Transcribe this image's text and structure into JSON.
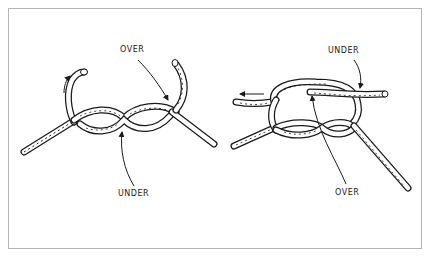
{
  "diagram": {
    "panels": [
      {
        "name": "left-knot",
        "labels": {
          "top": "OVER",
          "bottom": "UNDER"
        }
      },
      {
        "name": "right-knot",
        "labels": {
          "top": "UNDER",
          "bottom": "OVER"
        }
      }
    ],
    "colors": {
      "line": "#1a1a1a",
      "border": "#b5b5b5",
      "background": "#ffffff"
    }
  }
}
